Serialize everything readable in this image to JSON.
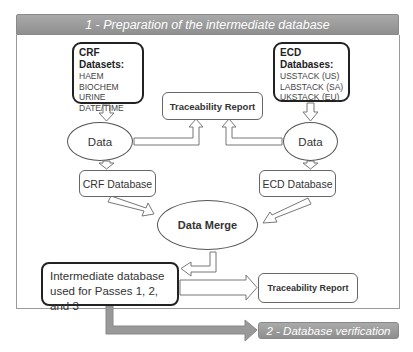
{
  "diagram": {
    "header": {
      "title": "1 - Preparation of the intermediate database"
    },
    "crf_datasets": {
      "title": "CRF Datasets:",
      "items": [
        "HAEM",
        "BIOCHEM",
        "URINE",
        "DATE/TIME"
      ]
    },
    "ecd_databases": {
      "title": "ECD Databases:",
      "items": [
        "USSTACK (US)",
        "LABSTACK (SA)",
        "UKSTACK (EU)"
      ]
    },
    "traceability_top": {
      "label": "Traceability Report"
    },
    "data_left": {
      "label": "Data"
    },
    "data_right": {
      "label": "Data"
    },
    "crf_database": {
      "label": "CRF Database"
    },
    "ecd_database": {
      "label": "ECD Database"
    },
    "data_merge": {
      "label": "Data Merge"
    },
    "intermediate": {
      "line1": "Intermediate database",
      "line2": "used for Passes 1, 2, and 3"
    },
    "traceability_bottom": {
      "label": "Traceability Report"
    },
    "next_step": {
      "label": "2 - Database verification"
    },
    "colors": {
      "banner_gray": "#999999",
      "border_dark": "#222222",
      "border_light": "#666666",
      "frame": "#9a9a9a"
    }
  }
}
